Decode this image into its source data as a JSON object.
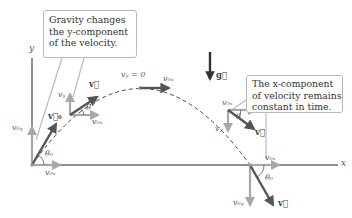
{
  "figure": {
    "axes": {
      "x_label": "x",
      "y_label": "y"
    },
    "callouts": {
      "gravity": {
        "lines": [
          "Gravity changes",
          "the y-component",
          "of the velocity."
        ]
      },
      "x_component": {
        "lines": [
          "The x-component",
          "of velocity remains",
          "constant in time."
        ]
      }
    },
    "gravity_vector": {
      "label": "g⃗",
      "symbol": "g"
    },
    "points": {
      "launch": {
        "v_label": "v⃗₀",
        "vx_label": "v₀ₓ",
        "vy_label": "v₀ᵧ",
        "angle_label": "θ₀"
      },
      "rising": {
        "v_label": "v⃗",
        "vx_label": "v₀ₓ",
        "vy_label": "vᵧ",
        "angle_label": "θ"
      },
      "apex": {
        "vy_label": "vᵧ = 0",
        "vx_label": "v₀ₓ"
      },
      "falling": {
        "v_label": "v⃗",
        "vx_label": "v₀ₓ",
        "vy_label": "vᵧ",
        "angle_label": "θ"
      },
      "landing": {
        "v_label": "v⃗",
        "vx_label": "v₀ₓ",
        "vy_label": "v₀ᵧ",
        "angle_label": "θ₀"
      }
    },
    "colors": {
      "velocity_vector": "#555555",
      "component_vector": "#a8a8a8",
      "axis": "#666666",
      "trajectory": "#444444",
      "gravity": "#333333",
      "callout_border": "#b8b8b8"
    }
  }
}
